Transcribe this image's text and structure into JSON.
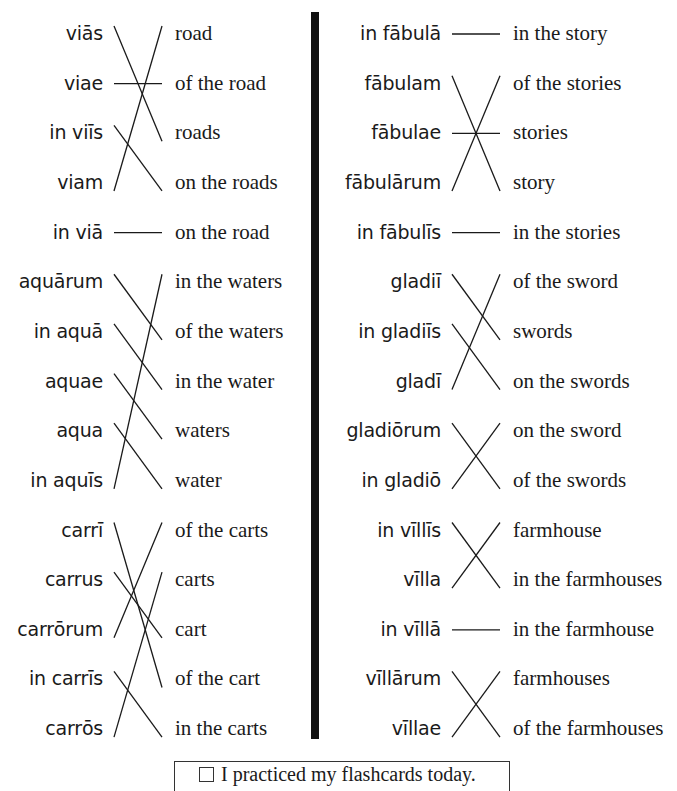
{
  "worksheet": {
    "columns": [
      {
        "groups": [
          {
            "latin": [
              "viās",
              "viae",
              "in viīs",
              "viam",
              "in viā"
            ],
            "english": [
              "road",
              "of the road",
              "roads",
              "on the roads",
              "on the road"
            ],
            "matches": [
              2,
              1,
              3,
              0,
              4
            ]
          },
          {
            "latin": [
              "aquārum",
              "in aquā",
              "aquae",
              "aqua",
              "in aquīs"
            ],
            "english": [
              "in the waters",
              "of the waters",
              "in the water",
              "waters",
              "water"
            ],
            "matches": [
              1,
              2,
              3,
              4,
              0
            ]
          },
          {
            "latin": [
              "carrī",
              "carrus",
              "carrōrum",
              "in carrīs",
              "carrōs"
            ],
            "english": [
              "of the carts",
              "carts",
              "cart",
              "of the cart",
              "in the carts"
            ],
            "matches": [
              3,
              2,
              0,
              4,
              1
            ]
          }
        ]
      },
      {
        "groups": [
          {
            "latin": [
              "in fābulā",
              "fābulam",
              "fābulae",
              "fābulārum",
              "in fābulīs"
            ],
            "english": [
              "in the story",
              "of the stories",
              "stories",
              "story",
              "in the stories"
            ],
            "matches": [
              0,
              3,
              2,
              1,
              4
            ]
          },
          {
            "latin": [
              "gladiī",
              "in gladiīs",
              "gladī",
              "gladiōrum",
              "in gladiō"
            ],
            "english": [
              "of the sword",
              "swords",
              "on the swords",
              "on the sword",
              "of the swords"
            ],
            "matches": [
              1,
              2,
              0,
              4,
              3
            ]
          },
          {
            "latin": [
              "in vīllīs",
              "vīlla",
              "in vīllā",
              "vīllārum",
              "vīllae"
            ],
            "english": [
              "farmhouse",
              "in the farmhouses",
              "in the farmhouse",
              "farmhouses",
              "of the farmhouses"
            ],
            "matches": [
              1,
              0,
              2,
              4,
              3
            ]
          }
        ]
      }
    ]
  },
  "footer": {
    "checkbox_checked": false,
    "label": "I practiced my flashcards today."
  }
}
